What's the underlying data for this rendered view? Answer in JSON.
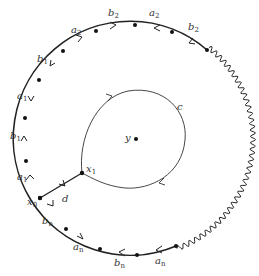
{
  "diagram": {
    "colors": {
      "stroke": "#222222",
      "dot": "#111111",
      "label": "#333333"
    },
    "outer_labels": [
      {
        "id": "b2-top-left",
        "text": "b",
        "sub": "2",
        "x": 115,
        "y": 9
      },
      {
        "id": "a2-top",
        "text": "a",
        "sub": "2",
        "x": 149,
        "y": 9
      },
      {
        "id": "b2-top-right",
        "text": "b",
        "sub": "2",
        "x": 185,
        "y": 22
      },
      {
        "id": "a2-upper-left",
        "text": "a",
        "sub": "2",
        "x": 71,
        "y": 26
      },
      {
        "id": "b1-upper-left",
        "text": "b",
        "sub": "1",
        "x": 38,
        "y": 55
      },
      {
        "id": "a1-left-upper",
        "text": "a",
        "sub": "1",
        "x": 17,
        "y": 92
      },
      {
        "id": "b1-left",
        "text": "b",
        "sub": "1",
        "x": 11,
        "y": 131
      },
      {
        "id": "a1-left-lower",
        "text": "a",
        "sub": "1",
        "x": 17,
        "y": 173
      },
      {
        "id": "bn-lower-left",
        "text": "b",
        "sub": "n",
        "x": 44,
        "y": 218
      },
      {
        "id": "an-bottom-left",
        "text": "a",
        "sub": "n",
        "x": 74,
        "y": 243
      },
      {
        "id": "bn-bottom",
        "text": "b",
        "sub": "n",
        "x": 115,
        "y": 259
      },
      {
        "id": "an-bottom-right",
        "text": "a",
        "sub": "n",
        "x": 155,
        "y": 258
      }
    ],
    "point_labels": [
      {
        "id": "x0",
        "text": "x",
        "sub": "0",
        "x": 27,
        "y": 197
      },
      {
        "id": "x1",
        "text": "x",
        "sub": "1",
        "x": 87,
        "y": 166
      },
      {
        "id": "y",
        "text": "y",
        "sub": "",
        "x": 124,
        "y": 133
      }
    ],
    "edge_labels": [
      {
        "id": "c",
        "text": "c",
        "sub": "",
        "x": 176,
        "y": 103
      },
      {
        "id": "d",
        "text": "d",
        "sub": "",
        "x": 61,
        "y": 194
      }
    ]
  }
}
